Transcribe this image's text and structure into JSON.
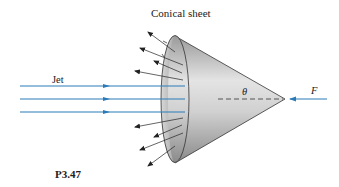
{
  "figure": {
    "title": "Conical sheet",
    "jet_label": "Jet",
    "angle_label": "θ",
    "force_label": "F",
    "problem_label": "P3.47"
  },
  "colors": {
    "jet_stream": "#2a7ab8",
    "cone_light": "#e6e6e6",
    "cone_dark": "#8c8c8c",
    "outline": "#222222"
  }
}
